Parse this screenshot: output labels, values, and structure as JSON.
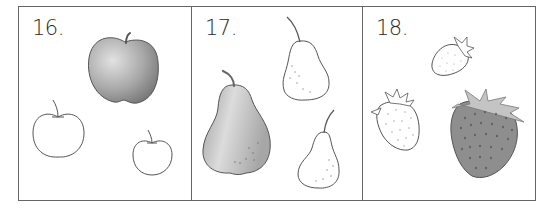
{
  "worksheet": {
    "panels": [
      {
        "number": "16.",
        "subject": "apples",
        "items": [
          {
            "kind": "apple",
            "style": "shaded",
            "size": "large"
          },
          {
            "kind": "apple",
            "style": "outline",
            "size": "medium"
          },
          {
            "kind": "apple",
            "style": "outline",
            "size": "small"
          }
        ]
      },
      {
        "number": "17.",
        "subject": "pears",
        "items": [
          {
            "kind": "pear",
            "style": "shaded",
            "size": "large"
          },
          {
            "kind": "pear",
            "style": "outline",
            "size": "medium"
          },
          {
            "kind": "pear",
            "style": "outline",
            "size": "small"
          }
        ]
      },
      {
        "number": "18.",
        "subject": "strawberries",
        "items": [
          {
            "kind": "strawberry",
            "style": "outline",
            "size": "small"
          },
          {
            "kind": "strawberry",
            "style": "outline",
            "size": "medium"
          },
          {
            "kind": "strawberry",
            "style": "shaded",
            "size": "large"
          }
        ]
      }
    ],
    "colors": {
      "border": "#666666",
      "outline": "#555555",
      "apple_shade_light": "#d8d8d8",
      "apple_shade_dark": "#7a7a7a",
      "pear_shade_light": "#e0e0e0",
      "pear_shade_dark": "#9a9a9a",
      "strawberry_body": "#8e8e8e",
      "strawberry_leaves": "#c4c4c4"
    }
  }
}
